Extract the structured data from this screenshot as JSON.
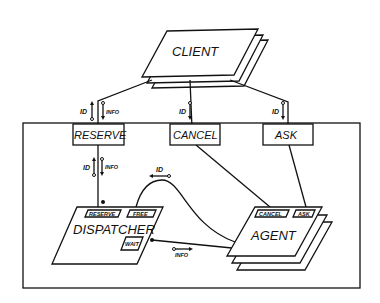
{
  "diagram": {
    "client": {
      "label": "CLIENT"
    },
    "interfaces": {
      "reserve": {
        "label": "RESERVE",
        "in_flow": "ID",
        "out_flow": "INFO"
      },
      "cancel": {
        "label": "CANCEL",
        "in_flow": "ID"
      },
      "ask": {
        "label": "ASK",
        "in_flow": "ID"
      }
    },
    "reserve_to_dispatcher": {
      "in_flow": "ID",
      "out_flow": "INFO"
    },
    "dispatcher": {
      "label": "DISPATCHER",
      "ports": {
        "reserve": "RESERVE",
        "free": "FREE",
        "wait": "WAIT"
      }
    },
    "agent": {
      "label": "AGENT",
      "ports": {
        "cancel": "CANCEL",
        "ask": "ASK"
      }
    },
    "free_to_agent_flow": "ID",
    "wait_to_agent_flow": "INFO"
  }
}
